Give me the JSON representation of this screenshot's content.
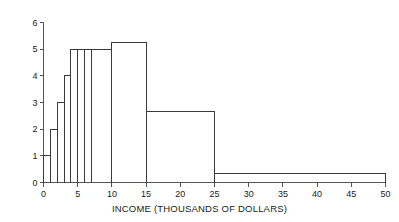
{
  "chart_data": {
    "type": "bar",
    "title": "",
    "subtitle": "",
    "xlabel": "INCOME (THOUSANDS OF DOLLARS)",
    "ylabel": "",
    "xlim": [
      0,
      50
    ],
    "ylim": [
      0,
      6
    ],
    "xticks": [
      0,
      5,
      10,
      15,
      20,
      25,
      30,
      35,
      40,
      45,
      50
    ],
    "xtick_labels": [
      "0",
      "5",
      "10",
      "15",
      "20",
      "25",
      "30",
      "35",
      "40",
      "45",
      "50"
    ],
    "yticks": [
      0,
      1,
      2,
      3,
      4,
      5,
      6
    ],
    "ytick_labels": [
      "0",
      "1",
      "2",
      "3",
      "4",
      "5",
      "6"
    ],
    "grid": false,
    "legend": null,
    "annotations": [],
    "bar_color": "#ffffff",
    "bar_edge_color": "#3a3a3a",
    "axis_color": "#555555",
    "text_color": "#1a1a1a",
    "bins": [
      {
        "label": "0-1",
        "x0": 0,
        "x1": 1,
        "height": 1.0
      },
      {
        "label": "1-2",
        "x0": 1,
        "x1": 2,
        "height": 2.0
      },
      {
        "label": "2-3",
        "x0": 2,
        "x1": 3,
        "height": 3.0
      },
      {
        "label": "3-4",
        "x0": 3,
        "x1": 4,
        "height": 4.0
      },
      {
        "label": "4-5",
        "x0": 4,
        "x1": 5,
        "height": 5.0
      },
      {
        "label": "5-6",
        "x0": 5,
        "x1": 6,
        "height": 5.0
      },
      {
        "label": "6-7",
        "x0": 6,
        "x1": 7,
        "height": 5.0
      },
      {
        "label": "7-10",
        "x0": 7,
        "x1": 10,
        "height": 5.0
      },
      {
        "label": "10-15",
        "x0": 10,
        "x1": 15,
        "height": 5.25
      },
      {
        "label": "15-25",
        "x0": 15,
        "x1": 25,
        "height": 2.65
      },
      {
        "label": "25-50",
        "x0": 25,
        "x1": 50,
        "height": 0.35
      }
    ],
    "categories": [
      "0-1",
      "1-2",
      "2-3",
      "3-4",
      "4-5",
      "5-6",
      "6-7",
      "7-10",
      "10-15",
      "15-25",
      "25-50"
    ],
    "values": [
      1.0,
      2.0,
      3.0,
      4.0,
      5.0,
      5.0,
      5.0,
      5.0,
      5.25,
      2.65,
      0.35
    ]
  }
}
